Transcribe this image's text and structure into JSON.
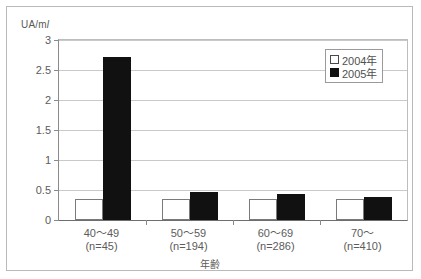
{
  "chart_data": {
    "type": "bar",
    "title": "",
    "xlabel": "年齢",
    "ylabel": "UA/ml",
    "ylim": [
      0,
      3
    ],
    "yticks": [
      "0",
      "0.5",
      "1",
      "1.5",
      "2",
      "2.5",
      "3"
    ],
    "ytick_values": [
      0,
      0.5,
      1,
      1.5,
      2,
      2.5,
      3
    ],
    "grid": true,
    "legend_position": "top-right",
    "categories": [
      "40~49\n(n=45)",
      "50~59\n(n=194)",
      "60~69\n(n=286)",
      "70~\n(n=410)"
    ],
    "category_rows": [
      {
        "range": "40～49",
        "count": "(n=45)"
      },
      {
        "range": "50～59",
        "count": "(n=194)"
      },
      {
        "range": "60～69",
        "count": "(n=286)"
      },
      {
        "range": "70～",
        "count": "(n=410)"
      }
    ],
    "series": [
      {
        "name": "2004年",
        "color": "#ffffff",
        "values": [
          0.35,
          0.35,
          0.35,
          0.35
        ]
      },
      {
        "name": "2005年",
        "color": "#111111",
        "values": [
          2.71,
          0.46,
          0.43,
          0.38
        ]
      }
    ]
  },
  "axis": {
    "y_unit_prefix": "UA/m",
    "y_unit_suffix": "l",
    "x_title": "年齢"
  },
  "legend": {
    "items": [
      {
        "label": "2004年",
        "swatch": "white-square-swatch"
      },
      {
        "label": "2005年",
        "swatch": "black-square-swatch"
      }
    ]
  }
}
